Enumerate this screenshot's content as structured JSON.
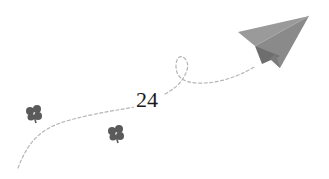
{
  "page": {
    "number": "24"
  },
  "decoration": {
    "airplane": {
      "icon": "paper-airplane-icon",
      "color": "#8a8a8a",
      "shade": "#6f6f6f",
      "light": "#9c9c9c"
    },
    "trail": {
      "icon": "dashed-flight-path",
      "color": "#b5b5b5"
    },
    "clovers": [
      {
        "icon": "clover-icon",
        "color": "#5a5a5a"
      },
      {
        "icon": "clover-icon",
        "color": "#5a5a5a"
      }
    ]
  }
}
